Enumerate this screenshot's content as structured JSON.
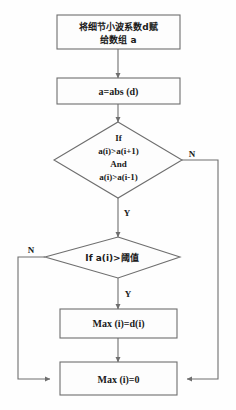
{
  "diagram": {
    "type": "flowchart",
    "colors": {
      "background": "#fefefe",
      "stroke": "#6e6e6e",
      "shape_fill": "#fdfdfd",
      "text": "#1a1a1a"
    },
    "nodes": [
      {
        "id": "assign-coefficients",
        "shape": "process",
        "lines": [
          "将细节小波系数d赋",
          "给数组 a"
        ],
        "script": "cjk"
      },
      {
        "id": "abs-value",
        "shape": "process",
        "lines": [
          "a=abs (d)"
        ],
        "script": "latin"
      },
      {
        "id": "local-maximum-test",
        "shape": "decision",
        "lines": [
          "If",
          "a(i)>a(i+1)",
          "And",
          "a(i)>a(i-1)"
        ],
        "script": "latin"
      },
      {
        "id": "threshold-test",
        "shape": "decision",
        "lines": [
          "If a(i)>阈值"
        ],
        "script": "cjk"
      },
      {
        "id": "set-max-to-d",
        "shape": "process",
        "lines": [
          "Max (i)=d(i)"
        ],
        "script": "latin"
      },
      {
        "id": "set-max-to-zero",
        "shape": "process",
        "lines": [
          "Max (i)=0"
        ],
        "script": "latin"
      }
    ],
    "edge_labels": {
      "local_max_no": "N",
      "local_max_yes": "Y",
      "threshold_no": "N",
      "threshold_yes": "Y"
    }
  }
}
